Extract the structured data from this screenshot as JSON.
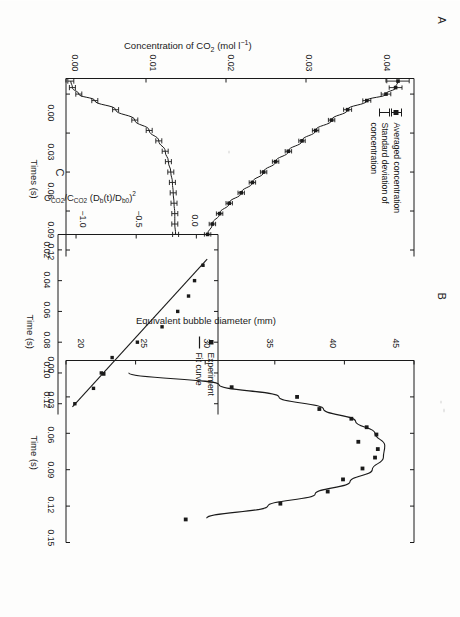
{
  "figure": {
    "background_color": "#fdfdfc",
    "ink_color": "#1a1a1a",
    "panels": [
      "A",
      "B",
      "C"
    ]
  },
  "panelA": {
    "letter": "A",
    "ylabel": "Concentration of CO₂ (mol l⁻¹)",
    "xlabel": "Times (s)",
    "legend": [
      {
        "key": "square-with-errorbar",
        "label": "Averaged concentration"
      },
      {
        "key": "errorbar",
        "label": "Standard deviation of concentration"
      }
    ],
    "yticks": [
      "0.00",
      "0.01",
      "0.02",
      "0.03",
      "0.04"
    ],
    "xticks": [
      "0.00",
      "0.03",
      "0.06",
      "0.09",
      "0.12"
    ]
  },
  "panelB": {
    "letter": "B",
    "ylabel": "Equivalent bubble diameter (mm)",
    "xlabel": "Time (s)",
    "yticks": [
      "20",
      "25",
      "30",
      "35",
      "40",
      "45"
    ],
    "xticks": [
      "0.00",
      "0.03",
      "0.06",
      "0.09",
      "0.12",
      "0.15"
    ]
  },
  "panelC": {
    "letter": "C",
    "ylabel_main": "C",
    "ylabel_sub1": "CO2",
    "ylabel_mid": "/C",
    "ylabel_sub2": "CO2",
    "ylabel_tail": " (D",
    "ylabel_sub3": "b",
    "ylabel_tail2": "(t)/D",
    "ylabel_sub4": "b0",
    "ylabel_tail3": ")",
    "ylabel_sup": "2",
    "ylabel_plain": "CCO2/CCO2 (Db(t)/Db0)2",
    "xlabel": "Time (s)",
    "legend": [
      {
        "key": "square",
        "label": "Experiment"
      },
      {
        "key": "line",
        "label": "Fit curve"
      }
    ],
    "yticks": [
      "0.0",
      "−0.5",
      "−1.0"
    ],
    "xticks": [
      "0.02",
      "0.04",
      "0.06",
      "0.08",
      "0.10",
      "0.12"
    ]
  },
  "chart_data": [
    {
      "type": "line",
      "panel": "A",
      "title": "",
      "xlabel": "Times (s)",
      "ylabel": "Concentration of CO₂ (mol l⁻¹)",
      "xlim": [
        -0.012,
        0.125
      ],
      "ylim": [
        0.0,
        0.0435
      ],
      "xticks": [
        0.0,
        0.03,
        0.06,
        0.09,
        0.12
      ],
      "yticks": [
        0.0,
        0.01,
        0.02,
        0.03,
        0.04
      ],
      "grid": false,
      "legend_position": "upper-left",
      "series": [
        {
          "name": "Averaged concentration",
          "marker": "square",
          "x": [
            -0.01,
            -0.005,
            0.0,
            0.005,
            0.012,
            0.02,
            0.028,
            0.036,
            0.044,
            0.052,
            0.06,
            0.068,
            0.076,
            0.084,
            0.092,
            0.1,
            0.108
          ],
          "y": [
            0.0415,
            0.0412,
            0.04,
            0.0376,
            0.0352,
            0.0332,
            0.0312,
            0.0295,
            0.0278,
            0.0262,
            0.0247,
            0.0233,
            0.0219,
            0.0204,
            0.0192,
            0.0183,
            0.0177
          ],
          "yerr": [
            0.0014,
            0.0008,
            0.0006,
            0.0005,
            0.0005,
            0.0004,
            0.0004,
            0.0004,
            0.0004,
            0.0004,
            0.0004,
            0.0004,
            0.0004,
            0.0004,
            0.0004,
            0.0004,
            0.0004
          ]
        },
        {
          "name": "Standard deviation of concentration",
          "marker": "errorbar",
          "x": [
            -0.01,
            -0.005,
            0.0,
            0.005,
            0.012,
            0.02,
            0.028,
            0.036,
            0.044,
            0.052,
            0.06,
            0.068,
            0.076,
            0.084,
            0.092,
            0.1,
            0.108
          ],
          "y": [
            0.0006,
            0.0008,
            0.0016,
            0.0036,
            0.0062,
            0.0086,
            0.0104,
            0.0116,
            0.0124,
            0.0128,
            0.0131,
            0.0133,
            0.0134,
            0.0135,
            0.0136,
            0.0136,
            0.0137
          ]
        }
      ]
    },
    {
      "type": "scatter",
      "panel": "B",
      "title": "",
      "xlabel": "Time (s)",
      "ylabel": "Equivalent bubble diameter (mm)",
      "xlim": [
        0.0,
        0.15
      ],
      "ylim": [
        20,
        45
      ],
      "xticks": [
        0.0,
        0.03,
        0.06,
        0.09,
        0.12,
        0.15
      ],
      "yticks": [
        20,
        25,
        30,
        35,
        40,
        45
      ],
      "grid": false,
      "series": [
        {
          "name": "Experiment",
          "marker": "square",
          "x": [
            0.011,
            0.022,
            0.03,
            0.04,
            0.048,
            0.055,
            0.061,
            0.067,
            0.073,
            0.08,
            0.089,
            0.098,
            0.108,
            0.118,
            0.131
          ],
          "y": [
            22.7,
            31.9,
            36.6,
            38.2,
            40.5,
            41.6,
            42.3,
            41.0,
            42.4,
            42.2,
            41.3,
            39.9,
            38.8,
            35.4,
            28.6
          ]
        },
        {
          "name": "Fit curve",
          "marker": "line",
          "x": [
            0.01,
            0.02,
            0.03,
            0.04,
            0.05,
            0.06,
            0.07,
            0.08,
            0.09,
            0.1,
            0.11,
            0.12,
            0.13
          ],
          "y": [
            24.5,
            31.0,
            35.3,
            38.5,
            40.8,
            42.2,
            42.9,
            42.8,
            42.0,
            40.4,
            37.9,
            34.5,
            30.1
          ]
        }
      ]
    },
    {
      "type": "scatter",
      "panel": "C",
      "title": "",
      "xlabel": "Time (s)",
      "ylabel": "CCO2/CCO2 (Db(t)/Db0)2",
      "xlim": [
        0.01,
        0.127
      ],
      "ylim": [
        -1.15,
        0.18
      ],
      "xticks": [
        0.02,
        0.04,
        0.06,
        0.08,
        0.1,
        0.12
      ],
      "yticks": [
        0.0,
        -0.5,
        -1.0
      ],
      "grid": false,
      "legend_position": "upper-right",
      "series": [
        {
          "name": "Experiment",
          "marker": "square",
          "x": [
            0.03,
            0.04,
            0.05,
            0.06,
            0.07,
            0.08,
            0.09,
            0.1,
            0.11,
            0.12
          ],
          "y": [
            0.055,
            -0.015,
            -0.065,
            -0.155,
            -0.285,
            -0.49,
            -0.7,
            -0.79,
            -0.855,
            -1.01
          ]
        },
        {
          "name": "Fit curve",
          "marker": "line",
          "x": [
            0.026,
            0.122
          ],
          "y": [
            0.09,
            -1.03
          ]
        }
      ]
    }
  ]
}
